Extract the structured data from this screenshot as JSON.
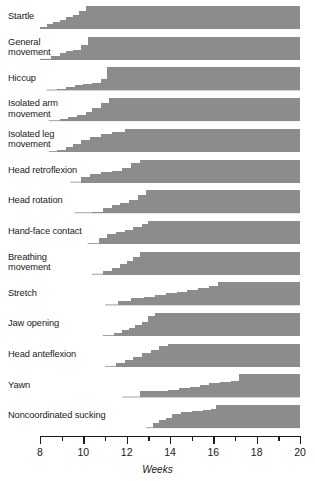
{
  "figure": {
    "axis": {
      "label": "Weeks",
      "min": 8,
      "max": 20,
      "major_ticks": [
        8,
        10,
        12,
        14,
        16,
        18,
        20
      ],
      "minor_ticks": [
        9,
        11,
        13,
        15,
        17,
        19
      ],
      "tick_labels": [
        "8",
        "10",
        "12",
        "14",
        "16",
        "18",
        "20"
      ]
    },
    "colors": {
      "fill": "#8c8c8c",
      "ink": "#1a1a1a",
      "background": "#ffffff"
    }
  },
  "chart_data": {
    "type": "area",
    "xlabel": "Weeks",
    "ylabel": "",
    "xlim": [
      8,
      20
    ],
    "ylim": [
      0,
      100
    ],
    "grid": false,
    "legend": "none",
    "units": "percent of fetuses showing the movement",
    "series": [
      {
        "name": "Startle",
        "label": "Startle",
        "x": [
          8.0,
          8.3,
          8.6,
          8.9,
          9.2,
          9.5,
          9.8,
          10.1,
          20.0
        ],
        "values": [
          10,
          22,
          30,
          40,
          52,
          62,
          78,
          100,
          100
        ]
      },
      {
        "name": "General movement",
        "label": "General\nmovement",
        "x": [
          8.0,
          8.5,
          8.9,
          9.2,
          9.5,
          9.9,
          10.2,
          20.0
        ],
        "values": [
          4,
          18,
          30,
          40,
          44,
          66,
          100,
          100
        ]
      },
      {
        "name": "Hiccup",
        "label": "Hiccup",
        "x": [
          8.3,
          8.8,
          9.2,
          9.6,
          10.0,
          10.4,
          10.8,
          11.1,
          20.0
        ],
        "values": [
          0,
          6,
          14,
          22,
          30,
          34,
          50,
          100,
          100
        ]
      },
      {
        "name": "Isolated arm movement",
        "label": "Isolated arm\nmovement",
        "x": [
          8.4,
          8.9,
          9.3,
          9.7,
          10.1,
          10.4,
          10.8,
          11.2,
          20.0
        ],
        "values": [
          0,
          8,
          16,
          26,
          40,
          58,
          80,
          100,
          100
        ]
      },
      {
        "name": "Isolated leg movement",
        "label": "Isolated leg\nmovement",
        "x": [
          8.4,
          8.8,
          9.2,
          9.5,
          9.9,
          10.3,
          10.8,
          11.3,
          11.9,
          20.0
        ],
        "values": [
          0,
          10,
          22,
          34,
          52,
          64,
          76,
          86,
          100,
          100
        ]
      },
      {
        "name": "Head retroflexion",
        "label": "Head retroflexion",
        "x": [
          9.4,
          9.9,
          10.3,
          10.8,
          11.3,
          11.8,
          12.2,
          12.6,
          20.0
        ],
        "values": [
          0,
          22,
          36,
          44,
          52,
          62,
          84,
          100,
          100
        ]
      },
      {
        "name": "Head rotation",
        "label": "Head rotation",
        "x": [
          9.6,
          10.4,
          10.9,
          11.3,
          11.7,
          12.1,
          12.5,
          12.9,
          20.0
        ],
        "values": [
          0,
          4,
          22,
          36,
          44,
          56,
          80,
          100,
          100
        ]
      },
      {
        "name": "Hand-face contact",
        "label": "Hand-face contact",
        "x": [
          10.2,
          10.7,
          11.1,
          11.5,
          11.9,
          12.3,
          12.7,
          13.0,
          20.0
        ],
        "values": [
          0,
          26,
          42,
          52,
          62,
          74,
          88,
          100,
          100
        ]
      },
      {
        "name": "Breathing movement",
        "label": "Breathing\nmovement",
        "x": [
          10.4,
          10.9,
          11.3,
          11.7,
          12.0,
          12.3,
          12.6,
          20.0
        ],
        "values": [
          0,
          16,
          30,
          44,
          58,
          78,
          100,
          100
        ]
      },
      {
        "name": "Stretch",
        "label": "Stretch",
        "x": [
          11.0,
          11.6,
          12.2,
          12.8,
          13.3,
          13.8,
          14.3,
          14.8,
          15.3,
          15.8,
          16.2,
          20.0
        ],
        "values": [
          0,
          20,
          30,
          34,
          44,
          52,
          58,
          66,
          74,
          84,
          100,
          100
        ]
      },
      {
        "name": "Jaw opening",
        "label": "Jaw opening",
        "x": [
          10.9,
          11.4,
          11.8,
          12.1,
          12.4,
          12.7,
          13.0,
          13.3,
          20.0
        ],
        "values": [
          0,
          14,
          26,
          36,
          46,
          62,
          86,
          100,
          100
        ]
      },
      {
        "name": "Head anteflexion",
        "label": "Head anteflexion",
        "x": [
          11.0,
          11.5,
          11.9,
          12.3,
          12.7,
          13.1,
          13.5,
          13.9,
          20.0
        ],
        "values": [
          0,
          16,
          30,
          44,
          58,
          74,
          90,
          100,
          100
        ]
      },
      {
        "name": "Yawn",
        "label": "Yawn",
        "x": [
          11.8,
          12.6,
          13.3,
          13.9,
          14.4,
          14.9,
          15.4,
          15.8,
          16.3,
          16.8,
          17.2,
          20.0
        ],
        "values": [
          0,
          26,
          30,
          34,
          40,
          46,
          52,
          62,
          66,
          72,
          100,
          100
        ]
      },
      {
        "name": "Noncoordinated sucking",
        "label": "Noncoordinated sucking",
        "x": [
          12.9,
          13.2,
          13.5,
          13.8,
          14.1,
          14.5,
          15.0,
          15.5,
          15.9,
          16.1,
          20.0
        ],
        "values": [
          0,
          22,
          34,
          44,
          62,
          70,
          74,
          78,
          82,
          100,
          100
        ]
      }
    ]
  }
}
